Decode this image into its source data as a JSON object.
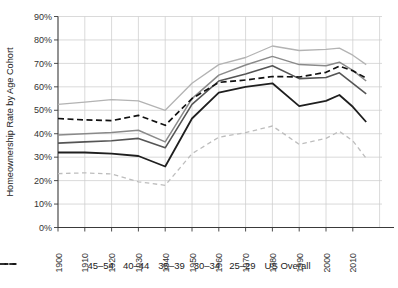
{
  "chart_data": {
    "type": "line",
    "title": "",
    "ylabel": "Homeownership Rate by Age Cohort",
    "xlabel": "",
    "grid": true,
    "legend_position": "bottom",
    "ylim": [
      0,
      90
    ],
    "xlim": [
      1900,
      2020
    ],
    "x": [
      1900,
      1910,
      1920,
      1930,
      1940,
      1950,
      1960,
      1970,
      1980,
      1990,
      2000,
      2005,
      2010,
      2015
    ],
    "y_ticks": {
      "values": [
        0,
        10,
        20,
        30,
        40,
        50,
        60,
        70,
        80,
        90
      ],
      "labels": [
        "0%",
        "10%",
        "20%",
        "30%",
        "40%",
        "50%",
        "60%",
        "70%",
        "80%",
        "90%"
      ]
    },
    "x_ticks": {
      "values": [
        1900,
        1910,
        1920,
        1930,
        1940,
        1950,
        1960,
        1970,
        1980,
        1990,
        2000,
        2010
      ],
      "labels": [
        "1900",
        "1910",
        "1920",
        "1930",
        "1940",
        "1950",
        "1960",
        "1970",
        "1980",
        "1990",
        "2000",
        "2010"
      ]
    },
    "series": [
      {
        "name": "45–54",
        "color": "#b3b3b3",
        "dash": "",
        "width": 1.3,
        "values": [
          52.5,
          53.5,
          54.5,
          54.0,
          50.0,
          61.5,
          69.5,
          72.5,
          77.4,
          75.5,
          76.0,
          76.5,
          73.5,
          69.5
        ]
      },
      {
        "name": "40–44",
        "color": "#8a8a8a",
        "dash": "",
        "width": 1.5,
        "values": [
          39.5,
          40.0,
          40.5,
          41.5,
          36.5,
          55.0,
          65.0,
          69.3,
          73.0,
          69.5,
          69.0,
          70.5,
          67.0,
          62.5
        ]
      },
      {
        "name": "35–39",
        "color": "#555555",
        "dash": "",
        "width": 1.6,
        "values": [
          36.0,
          36.5,
          37.0,
          38.0,
          34.0,
          52.5,
          62.5,
          65.5,
          69.0,
          63.5,
          64.0,
          66.0,
          61.5,
          57.0
        ]
      },
      {
        "name": "30–34",
        "color": "#1f1f1f",
        "dash": "",
        "width": 1.8,
        "values": [
          32.0,
          32.0,
          31.5,
          30.5,
          26.0,
          46.5,
          57.5,
          60.0,
          61.5,
          51.8,
          54.0,
          56.5,
          51.5,
          45.0
        ]
      },
      {
        "name": "25–29",
        "color": "#bdbdbd",
        "dash": "4.5,3.5",
        "width": 1.3,
        "values": [
          23.0,
          23.3,
          22.8,
          19.5,
          18.0,
          31.5,
          38.5,
          40.5,
          43.3,
          35.5,
          38.0,
          41.0,
          37.0,
          29.5
        ]
      },
      {
        "name": "US Overall",
        "color": "#111111",
        "dash": "6,3.5",
        "width": 1.7,
        "values": [
          46.5,
          45.9,
          45.6,
          47.8,
          43.6,
          55.0,
          61.9,
          62.9,
          64.4,
          64.2,
          66.2,
          68.8,
          66.9,
          63.7
        ]
      }
    ],
    "colors": {
      "grid": "#cdcdcd",
      "axis": "#3a3a3a",
      "text": "#333333",
      "background": "#ffffff"
    }
  }
}
